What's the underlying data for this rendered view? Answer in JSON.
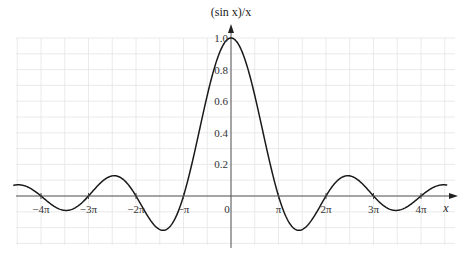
{
  "chart_data": {
    "type": "line",
    "title": "",
    "function": "(sin x)/x",
    "xlabel": "x",
    "ylabel": "(sin x)/x",
    "xlim": [
      -14.5,
      14.8
    ],
    "ylim": [
      -0.3,
      1.0
    ],
    "grid": true,
    "legend": null,
    "x_ticks": [
      {
        "value": -12.566,
        "label": "−4π"
      },
      {
        "value": -9.425,
        "label": "−3π"
      },
      {
        "value": -6.283,
        "label": "−2π"
      },
      {
        "value": -3.1416,
        "label": "−π"
      },
      {
        "value": 0,
        "label": "0"
      },
      {
        "value": 3.1416,
        "label": "π"
      },
      {
        "value": 6.283,
        "label": "2π"
      },
      {
        "value": 9.425,
        "label": "3π"
      },
      {
        "value": 12.566,
        "label": "4π"
      }
    ],
    "y_ticks": [
      {
        "value": 0.2,
        "label": "0.2"
      },
      {
        "value": 0.4,
        "label": "0.4"
      },
      {
        "value": 0.6,
        "label": "0.6"
      },
      {
        "value": 0.8,
        "label": "0.8"
      },
      {
        "value": 1.0,
        "label": "1.0"
      }
    ],
    "series": [
      {
        "name": "(sin x)/x",
        "x": [
          -14.1,
          -12.566,
          -10.904,
          -9.425,
          -7.725,
          -6.283,
          -4.493,
          -3.1416,
          0,
          3.1416,
          4.493,
          6.283,
          7.725,
          9.425,
          10.904,
          12.566,
          14.1
        ],
        "y": [
          0.071,
          0.0,
          -0.091,
          0.0,
          0.128,
          0.0,
          -0.217,
          0.0,
          1.0,
          0.0,
          -0.217,
          0.0,
          0.128,
          0.0,
          -0.091,
          0.0,
          0.071
        ]
      }
    ],
    "annotations": []
  },
  "axes": {
    "y_title": "(sin x)/x",
    "x_title": "x"
  },
  "layout": {
    "origin_px": [
      231,
      196
    ],
    "px_per_unit_x": 15.12,
    "px_per_unit_y": 158,
    "grid_x_range_px": [
      16,
      455
    ],
    "grid_y_range_px": [
      38,
      245
    ],
    "grid_step_px": 23.75,
    "curve_x_range": [
      -14.4,
      14.3
    ],
    "colors": {
      "curve": "#1a1a1a",
      "axis": "#555555",
      "grid": "#e4e4e4",
      "text": "#333333"
    }
  }
}
